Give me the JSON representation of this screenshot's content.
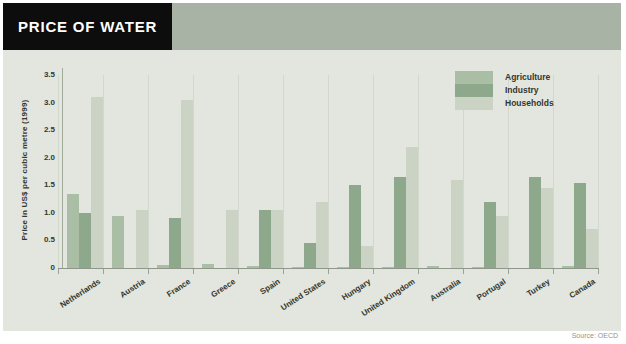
{
  "header": {
    "title": "PRICE OF WATER"
  },
  "colors": {
    "header_band": "#a8b2a5",
    "title_bg": "#0d0d0d",
    "chart_bg": "#e3e6de"
  },
  "source": {
    "label": "Source: OECD"
  },
  "chart_data": {
    "type": "bar",
    "title": "PRICE OF WATER",
    "ylabel": "Price in US$ per cubic metre (1999)",
    "xlabel": "",
    "ylim": [
      0,
      3.5
    ],
    "grid": "vertical-group-separators-only",
    "legend_position": "top-right",
    "yticks": [
      {
        "label": "3.5",
        "value": 3.5
      },
      {
        "label": "3.0",
        "value": 3.0
      },
      {
        "label": "2.5",
        "value": 2.5
      },
      {
        "label": "2.0",
        "value": 2.0
      },
      {
        "label": "1.5",
        "value": 1.5
      },
      {
        "label": "1.0",
        "value": 1.0
      },
      {
        "label": "0.5",
        "value": 0.5
      },
      {
        "label": "0",
        "value": 0
      }
    ],
    "categories": [
      "Netherlands",
      "Austria",
      "France",
      "Greece",
      "Spain",
      "United States",
      "Hungary",
      "United Kingdom",
      "Australia",
      "Portugal",
      "Turkey",
      "Canada"
    ],
    "series": [
      {
        "name": "Agriculture",
        "color": "#a9bea4",
        "values": [
          1.35,
          0.95,
          0.05,
          0.08,
          0.04,
          0.02,
          0.02,
          0.02,
          0.03,
          0.02,
          null,
          0.03
        ]
      },
      {
        "name": "Industry",
        "color": "#8ea88c",
        "values": [
          1.0,
          null,
          0.9,
          null,
          1.05,
          0.45,
          1.5,
          1.65,
          null,
          1.2,
          1.65,
          1.55
        ]
      },
      {
        "name": "Households",
        "color": "#cbd4c4",
        "values": [
          3.1,
          1.05,
          3.05,
          1.05,
          1.05,
          1.2,
          0.4,
          2.2,
          1.6,
          0.95,
          1.45,
          0.7
        ]
      }
    ]
  }
}
